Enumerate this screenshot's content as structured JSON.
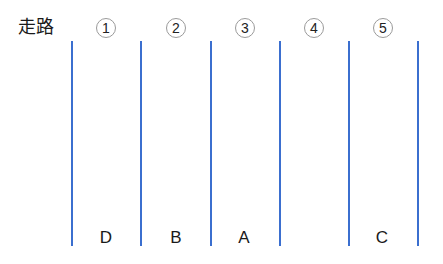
{
  "title": "走路",
  "line_color": "#3b6fcf",
  "lane_numbers": [
    "①",
    "②",
    "③",
    "④",
    "⑤"
  ],
  "lane_numbers_plain": [
    "1",
    "2",
    "3",
    "4",
    "5"
  ],
  "lanes": [
    {
      "number": "1",
      "occupant": "D"
    },
    {
      "number": "2",
      "occupant": "B"
    },
    {
      "number": "3",
      "occupant": "A"
    },
    {
      "number": "4",
      "occupant": ""
    },
    {
      "number": "5",
      "occupant": "C"
    }
  ]
}
